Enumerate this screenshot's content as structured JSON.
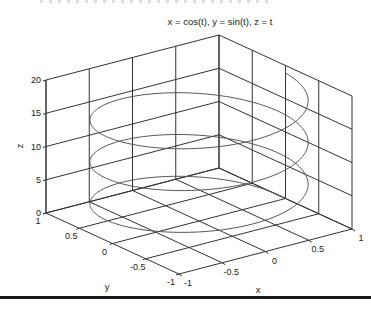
{
  "chart_data": {
    "type": "line3d",
    "title": "x = cos(t), y = sin(t), z = t",
    "xlabel": "x",
    "ylabel": "y",
    "zlabel": "z",
    "xlim": [
      -1,
      1
    ],
    "ylim": [
      -1,
      1
    ],
    "zlim": [
      0,
      20
    ],
    "xticks": [
      "-1",
      "-0.5",
      "0",
      "0.5",
      "1"
    ],
    "yticks": [
      "1",
      "0.5",
      "0",
      "-0.5",
      "-1"
    ],
    "zticks": [
      "0",
      "5",
      "10",
      "15",
      "20"
    ],
    "grid": true,
    "series": [
      {
        "name": "helix",
        "t_range": [
          0,
          18.85
        ],
        "x": "cos(t)",
        "y": "sin(t)",
        "z": "t",
        "color": "#555555"
      }
    ]
  },
  "colors": {
    "axes": "#333333",
    "grid": "#333333",
    "curve": "#555555",
    "background": "#ffffff"
  }
}
